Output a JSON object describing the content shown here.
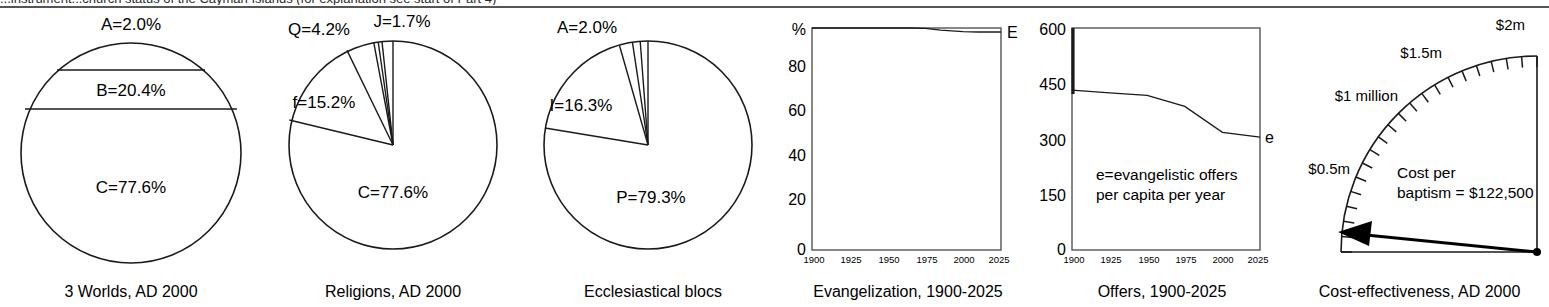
{
  "header": {
    "clipped_caption": "...instrument...church status of the Cayman Islands (for explanation see start of Part 4)"
  },
  "panels": [
    {
      "id": "three-worlds",
      "caption": "3 Worlds, AD 2000",
      "segments": [
        {
          "key": "A",
          "label": "A=2.0%",
          "value": 2.0
        },
        {
          "key": "B",
          "label": "B=20.4%",
          "value": 20.4
        },
        {
          "key": "C",
          "label": "C=77.6%",
          "value": 77.6
        }
      ]
    },
    {
      "id": "religions",
      "caption": "Religions, AD 2000",
      "segments": [
        {
          "key": "J",
          "label": "J=1.7%",
          "value": 1.7
        },
        {
          "key": "Q",
          "label": "Q=4.2%",
          "value": 4.2
        },
        {
          "key": "f",
          "label": "f=15.2%",
          "value": 15.2
        },
        {
          "key": "C",
          "label": "C=77.6%",
          "value": 77.6
        }
      ]
    },
    {
      "id": "ecclesiastical-blocs",
      "caption": "Ecclesiastical blocs",
      "segments": [
        {
          "key": "A",
          "label": "A=2.0%",
          "value": 2.0
        },
        {
          "key": "I",
          "label": "I=16.3%",
          "value": 16.3
        },
        {
          "key": "P",
          "label": "P=79.3%",
          "value": 79.3
        }
      ]
    },
    {
      "id": "evangelization",
      "caption": "Evangelization, 1900-2025"
    },
    {
      "id": "offers",
      "caption": "Offers, 1900-2025"
    },
    {
      "id": "cost-effectiveness",
      "caption": "Cost-effectiveness, AD 2000"
    }
  ],
  "chart_data": [
    {
      "type": "pie",
      "id": "three-worlds",
      "title": "3 Worlds, AD 2000",
      "note": "Drawn as horizontal bands within a circle",
      "categories": [
        "A",
        "B",
        "C"
      ],
      "values": [
        2.0,
        20.4,
        77.6
      ],
      "data_labels": [
        "A=2.0%",
        "B=20.4%",
        "C=77.6%"
      ],
      "units": "%"
    },
    {
      "type": "pie",
      "id": "religions",
      "title": "Religions, AD 2000",
      "categories": [
        "J",
        "unlabelled-1",
        "unlabelled-2",
        "Q",
        "f",
        "C"
      ],
      "values": [
        1.7,
        0.6,
        0.7,
        4.2,
        15.2,
        77.6
      ],
      "data_labels": [
        "J=1.7%",
        "",
        "",
        "Q=4.2%",
        "f=15.2%",
        "C=77.6%"
      ],
      "units": "%",
      "start_angle_deg": 90,
      "direction": "counterclockwise"
    },
    {
      "type": "pie",
      "id": "ecclesiastical-blocs",
      "title": "Ecclesiastical blocs",
      "categories": [
        "unlabelled-1",
        "unlabelled-2",
        "A",
        "I",
        "P"
      ],
      "values": [
        1.2,
        1.2,
        2.0,
        16.3,
        79.3
      ],
      "data_labels": [
        "",
        "",
        "A=2.0%",
        "I=16.3%",
        "P=79.3%"
      ],
      "units": "%",
      "start_angle_deg": 90,
      "direction": "counterclockwise"
    },
    {
      "type": "line",
      "id": "evangelization",
      "title": "Evangelization, 1900-2025",
      "xlabel": "",
      "ylabel": "%",
      "y_axis_top_label": "%",
      "xlim": [
        1900,
        2025
      ],
      "ylim": [
        0,
        100
      ],
      "xticks": [
        1900,
        1925,
        1950,
        1975,
        2000,
        2025
      ],
      "xtick_labels": [
        "1900",
        "1925",
        "1950",
        "1975",
        "2000",
        "2025"
      ],
      "yticks": [
        0,
        20,
        40,
        60,
        80
      ],
      "ytick_labels": [
        "0",
        "20",
        "40",
        "60",
        "80"
      ],
      "grid": false,
      "series": [
        {
          "name": "E",
          "end_label": "E",
          "x": [
            1900,
            1925,
            1950,
            1965,
            1975,
            1985,
            2000,
            2010,
            2025
          ],
          "values": [
            100,
            100,
            100,
            100,
            99.8,
            99.0,
            98.4,
            98.2,
            98.2
          ]
        }
      ]
    },
    {
      "type": "line",
      "id": "offers",
      "title": "Offers, 1900-2025",
      "xlabel": "",
      "ylabel": "",
      "annotation": "e=evangelistic offers\nper capita per year",
      "annotation_lines": [
        "e=evangelistic offers",
        "per capita per year"
      ],
      "xlim": [
        1900,
        2025
      ],
      "ylim": [
        0,
        600
      ],
      "xticks": [
        1900,
        1925,
        1950,
        1975,
        2000,
        2025
      ],
      "xtick_labels": [
        "1900",
        "1925",
        "1950",
        "1975",
        "2000",
        "2025"
      ],
      "yticks": [
        0,
        150,
        300,
        450,
        600
      ],
      "ytick_labels": [
        "0",
        "150",
        "300",
        "450",
        "600"
      ],
      "grid": false,
      "series": [
        {
          "name": "e",
          "end_label": "e",
          "x": [
            1900,
            1925,
            1950,
            1975,
            2000,
            2025
          ],
          "values": [
            432,
            425,
            418,
            388,
            318,
            305
          ]
        }
      ]
    },
    {
      "type": "gauge",
      "id": "cost-effectiveness",
      "title": "Cost-effectiveness, AD 2000",
      "range": [
        0,
        2000000
      ],
      "tick_labels": [
        "$0.5m",
        "$1 million",
        "$1.5m",
        "$2m"
      ],
      "tick_values": [
        500000,
        1000000,
        1500000,
        2000000
      ],
      "readout_lines": [
        "Cost per",
        "baptism = $122,500"
      ],
      "value": 122500,
      "value_label": "$122,500"
    }
  ]
}
